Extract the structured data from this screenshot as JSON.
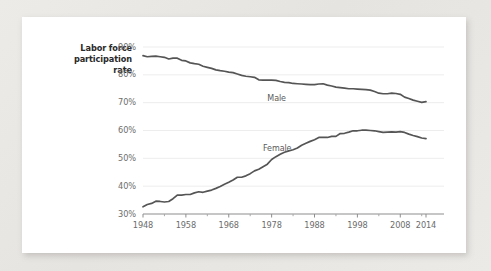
{
  "chart_data": {
    "type": "line",
    "title": "Labor force participation rate",
    "title_lines": [
      "Labor force",
      "participation",
      "rate"
    ],
    "xlabel": "",
    "ylabel": "Labor force participation rate",
    "xlim": [
      1948,
      2014
    ],
    "ylim": [
      30,
      90
    ],
    "grid": true,
    "legend": "inline-labels",
    "ytick_labels": [
      "90%",
      "80%",
      "70%",
      "60%",
      "50%",
      "40%",
      "30%"
    ],
    "ytick_values": [
      90,
      80,
      70,
      60,
      50,
      40,
      30
    ],
    "xtick_labels": [
      "1948",
      "1958",
      "1968",
      "1978",
      "1988",
      "1998",
      "2008",
      "2014"
    ],
    "xtick_values": [
      1948,
      1958,
      1968,
      1978,
      1988,
      1998,
      2008,
      2014
    ],
    "minor_xtick_values": [
      1953,
      1963,
      1973,
      1983,
      1993,
      2003,
      2013
    ],
    "line_color": "#555555",
    "x": [
      1948,
      1949,
      1950,
      1951,
      1952,
      1953,
      1954,
      1955,
      1956,
      1957,
      1958,
      1959,
      1960,
      1961,
      1962,
      1963,
      1964,
      1965,
      1966,
      1967,
      1968,
      1969,
      1970,
      1971,
      1972,
      1973,
      1974,
      1975,
      1976,
      1977,
      1978,
      1979,
      1980,
      1981,
      1982,
      1983,
      1984,
      1985,
      1986,
      1987,
      1988,
      1989,
      1990,
      1991,
      1992,
      1993,
      1994,
      1995,
      1996,
      1997,
      1998,
      1999,
      2000,
      2001,
      2002,
      2003,
      2004,
      2005,
      2006,
      2007,
      2008,
      2009,
      2010,
      2011,
      2012,
      2013,
      2014
    ],
    "series": [
      {
        "name": "Male",
        "label": "Male",
        "values": [
          86.9,
          86.5,
          86.6,
          86.7,
          86.5,
          86.3,
          85.7,
          86.0,
          86.0,
          85.2,
          85.0,
          84.3,
          84.0,
          83.8,
          83.1,
          82.7,
          82.3,
          81.8,
          81.5,
          81.3,
          81.0,
          80.8,
          80.3,
          79.8,
          79.5,
          79.3,
          79.1,
          78.2,
          78.1,
          78.1,
          78.1,
          78.0,
          77.6,
          77.3,
          77.2,
          76.9,
          76.8,
          76.7,
          76.6,
          76.5,
          76.5,
          76.7,
          76.8,
          76.3,
          76.0,
          75.6,
          75.4,
          75.2,
          75.0,
          75.0,
          74.9,
          74.8,
          74.7,
          74.5,
          74.0,
          73.4,
          73.2,
          73.2,
          73.4,
          73.3,
          73.0,
          72.0,
          71.5,
          70.9,
          70.5,
          70.1,
          70.4
        ]
      },
      {
        "name": "Female",
        "label": "Female",
        "values": [
          32.6,
          33.4,
          33.8,
          34.6,
          34.5,
          34.3,
          34.5,
          35.5,
          36.8,
          36.8,
          37.0,
          37.0,
          37.6,
          38.0,
          37.8,
          38.2,
          38.6,
          39.2,
          39.9,
          40.7,
          41.4,
          42.2,
          43.2,
          43.2,
          43.7,
          44.5,
          45.5,
          46.1,
          47.0,
          47.9,
          49.6,
          50.6,
          51.5,
          52.2,
          52.7,
          53.1,
          53.7,
          54.7,
          55.4,
          56.1,
          56.7,
          57.5,
          57.5,
          57.5,
          57.9,
          57.9,
          58.9,
          59.0,
          59.4,
          59.9,
          59.9,
          60.1,
          60.1,
          60.0,
          59.9,
          59.6,
          59.3,
          59.4,
          59.5,
          59.4,
          59.6,
          59.3,
          58.7,
          58.2,
          57.8,
          57.3,
          57.1
        ]
      }
    ]
  }
}
